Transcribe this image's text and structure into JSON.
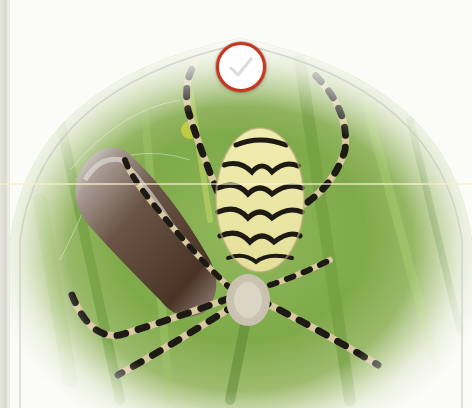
{
  "image": {
    "subject": "wasp spider with wrapped prey in grass",
    "alt": "Spider photo"
  },
  "selection": {
    "checked": false,
    "icon": "checkmark-icon",
    "ring_color": "#c9341e",
    "check_color": "#d8d8d8"
  },
  "colors": {
    "background": "#fbfbf7",
    "grass_light": "#a8c86a",
    "grass_dark": "#5f8a34",
    "spider_yellow": "#ece79a",
    "spider_black": "#1d1a14"
  }
}
